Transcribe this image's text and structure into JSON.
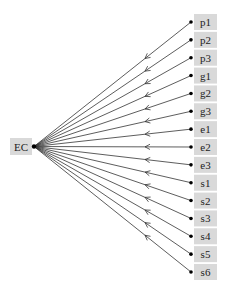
{
  "diagram": {
    "type": "path-diagram",
    "source_node": {
      "id": "EC",
      "label": "EC"
    },
    "target_nodes": [
      {
        "id": "p1",
        "label": "p1"
      },
      {
        "id": "p2",
        "label": "p2"
      },
      {
        "id": "p3",
        "label": "p3"
      },
      {
        "id": "g1",
        "label": "g1"
      },
      {
        "id": "g2",
        "label": "g2"
      },
      {
        "id": "g3",
        "label": "g3"
      },
      {
        "id": "e1",
        "label": "e1"
      },
      {
        "id": "e2",
        "label": "e2"
      },
      {
        "id": "e3",
        "label": "e3"
      },
      {
        "id": "s1",
        "label": "s1"
      },
      {
        "id": "s2",
        "label": "s2"
      },
      {
        "id": "s3",
        "label": "s3"
      },
      {
        "id": "s4",
        "label": "s4"
      },
      {
        "id": "s5",
        "label": "s5"
      },
      {
        "id": "s6",
        "label": "s6"
      }
    ],
    "edge_direction": "target-to-source",
    "colors": {
      "box_fill": "#d9d9d9",
      "line": "#333333",
      "dot": "#000000"
    }
  }
}
